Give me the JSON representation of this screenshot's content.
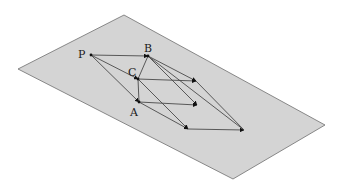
{
  "diagram": {
    "plane": {
      "fill": "#d4d4d4",
      "stroke": "#6e6e6e",
      "corners": [
        [
          124,
          15
        ],
        [
          325,
          125
        ],
        [
          233,
          179
        ],
        [
          18,
          69
        ]
      ]
    },
    "points": {
      "P": {
        "label": "P",
        "x": 91,
        "y": 55,
        "lx": 78,
        "ly": 58
      },
      "B": {
        "label": "B",
        "x": 148,
        "y": 56,
        "lx": 144,
        "ly": 52
      },
      "C": {
        "label": "C",
        "x": 138,
        "y": 79,
        "lx": 128,
        "ly": 76
      },
      "A": {
        "label": "A",
        "x": 139,
        "y": 102,
        "lx": 130,
        "ly": 116
      }
    },
    "endpoints": {
      "CB_end": [
        196,
        81
      ],
      "A_end": [
        197,
        105
      ],
      "lower": [
        188,
        129
      ],
      "far": [
        244,
        130
      ]
    },
    "line_color": "#4a4a4a",
    "arrow_color": "#111111"
  }
}
